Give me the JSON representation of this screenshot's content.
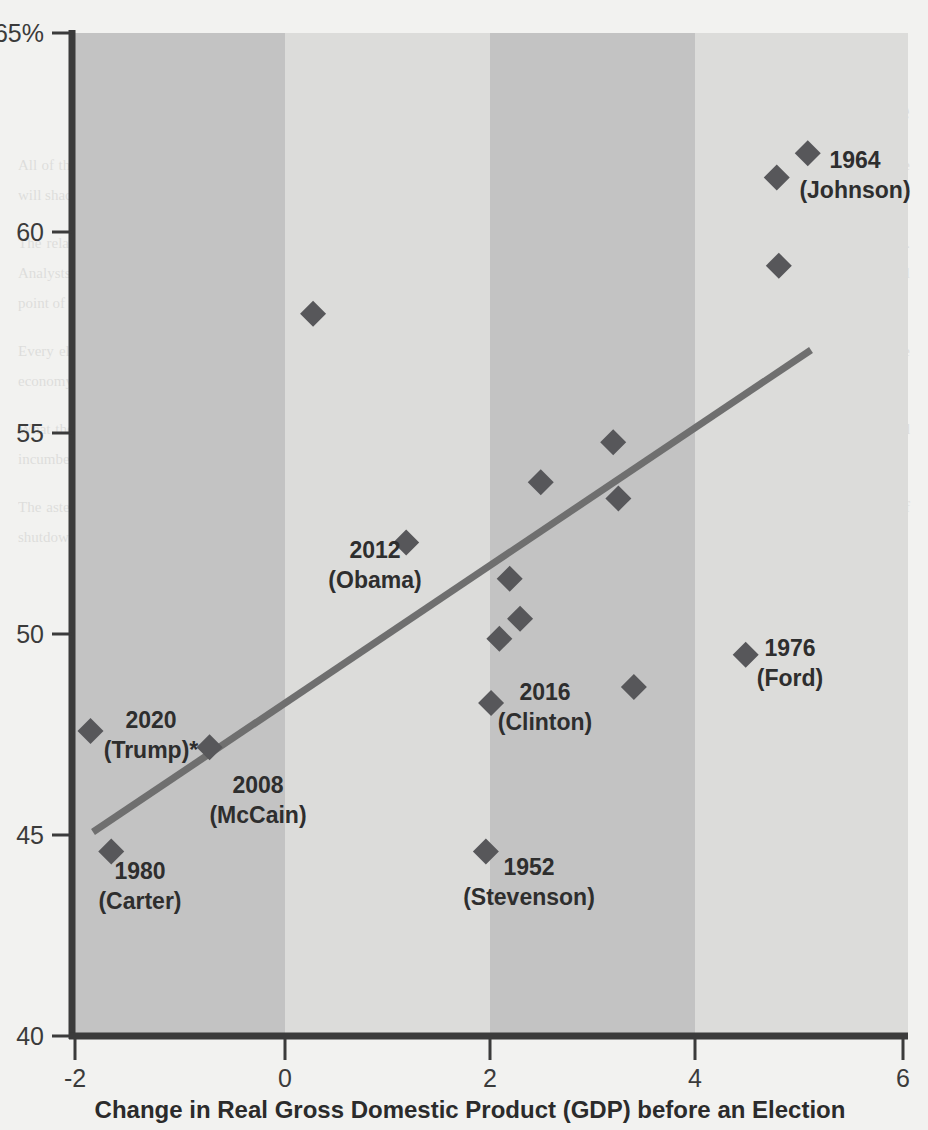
{
  "chart_data": {
    "type": "scatter",
    "title": "",
    "xlabel": "Change in Real Gross Domestic Product (GDP) before an Election",
    "ylabel": "",
    "xlim": [
      -2,
      6
    ],
    "ylim": [
      40,
      65
    ],
    "grid": false,
    "legend": "none",
    "xticks": [
      "-2",
      "0",
      "2",
      "4",
      "6"
    ],
    "xtick_values": [
      -2,
      0,
      2,
      4,
      6
    ],
    "yticks": [
      "40",
      "45",
      "50",
      "55",
      "60",
      "65%"
    ],
    "ytick_values": [
      40,
      45,
      50,
      55,
      60,
      65
    ],
    "background_bands": [
      {
        "from": -2,
        "to": 0,
        "shade": "dark"
      },
      {
        "from": 0,
        "to": 2,
        "shade": "light"
      },
      {
        "from": 2,
        "to": 4,
        "shade": "dark"
      },
      {
        "from": 4,
        "to": 6,
        "shade": "light"
      }
    ],
    "points": [
      {
        "x": -1.85,
        "y": 47.6,
        "label_year": "2020",
        "label_name": "(Trump)*"
      },
      {
        "x": -1.65,
        "y": 44.6,
        "label_year": "1980",
        "label_name": "(Carter)"
      },
      {
        "x": -0.7,
        "y": 47.2,
        "label_year": "2008",
        "label_name": "(McCain)"
      },
      {
        "x": 0.3,
        "y": 58.0,
        "label_year": "",
        "label_name": ""
      },
      {
        "x": 1.2,
        "y": 52.3,
        "label_year": "2012",
        "label_name": "(Obama)"
      },
      {
        "x": 1.97,
        "y": 44.6,
        "label_year": "1952",
        "label_name": "(Stevenson)"
      },
      {
        "x": 2.02,
        "y": 48.3,
        "label_year": "2016",
        "label_name": "(Clinton)"
      },
      {
        "x": 2.1,
        "y": 49.9,
        "label_year": "",
        "label_name": ""
      },
      {
        "x": 2.2,
        "y": 51.4,
        "label_year": "",
        "label_name": ""
      },
      {
        "x": 2.3,
        "y": 50.4,
        "label_year": "",
        "label_name": ""
      },
      {
        "x": 2.5,
        "y": 53.8,
        "label_year": "",
        "label_name": ""
      },
      {
        "x": 3.2,
        "y": 54.8,
        "label_year": "",
        "label_name": ""
      },
      {
        "x": 3.25,
        "y": 53.4,
        "label_year": "",
        "label_name": ""
      },
      {
        "x": 3.4,
        "y": 48.7,
        "label_year": "",
        "label_name": ""
      },
      {
        "x": 4.48,
        "y": 49.5,
        "label_year": "1976",
        "label_name": "(Ford)"
      },
      {
        "x": 4.78,
        "y": 61.4,
        "label_year": "",
        "label_name": ""
      },
      {
        "x": 4.8,
        "y": 59.2,
        "label_year": "",
        "label_name": ""
      },
      {
        "x": 5.08,
        "y": 62.0,
        "label_year": "1964",
        "label_name": "(Johnson)"
      }
    ],
    "trendline": {
      "x0": -1.85,
      "y0": 45.1,
      "x1": 5.15,
      "y1": 57.2
    },
    "colors": {
      "marker": "#57575a",
      "trendline": "#6f6f6f",
      "axis": "#3b3b3b",
      "band_dark": "#c3c3c3",
      "band_light": "#dcdcda",
      "page_background": "#f2f2f0"
    }
  },
  "labels": {
    "trump": {
      "year": "2020",
      "name": "(Trump)*"
    },
    "carter": {
      "year": "1980",
      "name": "(Carter)"
    },
    "mccain": {
      "year": "2008",
      "name": "(McCain)"
    },
    "obama": {
      "year": "2012",
      "name": "(Obama)"
    },
    "stevenson": {
      "year": "1952",
      "name": "(Stevenson)"
    },
    "clinton": {
      "year": "2016",
      "name": "(Clinton)"
    },
    "ford": {
      "year": "1976",
      "name": "(Ford)"
    },
    "johnson": {
      "year": "1964",
      "name": "(Johnson)"
    }
  },
  "axis": {
    "x_title": "Change in Real Gross Domestic Product (GDP) before an Election",
    "y_ticks": [
      "65%",
      "60",
      "55",
      "50",
      "45",
      "40"
    ],
    "x_ticks": [
      "-2",
      "0",
      "2",
      "4",
      "6"
    ]
  },
  "page_background_text": {
    "heading": "Setting the stage",
    "paragraphs": [
      "All of these are just general impressions of an economy whose exact shape has yet to settle into the history books. The data revisions still to come will shade the picture one way or another, and the final verdict on the period will depend on which series one chooses to privilege.",
      "The relationship between growth and the incumbent party's share of the two-party vote has never been tight, but it has never been absent either. Analysts who build election models around it typically find that a single point of additional growth buys somewhere between half a point and a full point of vote share, with wide error bands around that estimate.",
      "Every election carries its own idiosyncrasies — a war, a scandal, a third-party candidate, an unusually weak or unusually strong challenger. The economy sets the stage, but it does not write the whole script, and the residuals around any fitted line are large enough to swing most contests.",
      "What the scatter does show is a real tilt. The elections clustered on the left of the chart, where output was shrinking or barely growing, produced incumbent-party vote shares in the middle forties. The elections on the right, in periods of rapid expansion, produced the landslides.",
      "The asterisk on the most recent observation marks a year in which the measured change in output was distorted by an extraordinary sequence of shutdowns and reopenings, making the usual comparison far less meaningful than it would be in an ordinary cycle."
    ]
  }
}
